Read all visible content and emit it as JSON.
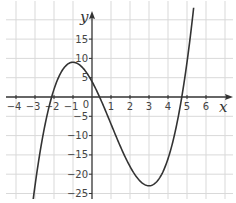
{
  "chart_data": {
    "type": "line",
    "title": "",
    "xlabel": "x",
    "ylabel": "y",
    "xlim": [
      -4.5,
      7.3
    ],
    "ylim": [
      -26.5,
      22.5
    ],
    "grid": true,
    "x_ticks": [
      -4,
      -3,
      -2,
      -1,
      0,
      1,
      2,
      3,
      4,
      5,
      6
    ],
    "x_tick_labels": [
      "-4",
      "-3",
      "-2",
      "-1",
      "0",
      "1",
      "2",
      "3",
      "4",
      "5",
      "6"
    ],
    "y_ticks": [
      -25,
      -20,
      -15,
      -10,
      -5,
      5,
      10,
      15
    ],
    "y_tick_labels": [
      "-25",
      "-20",
      "-15",
      "-10",
      "-5",
      "5",
      "10",
      "15"
    ],
    "series": [
      {
        "name": "y = x^3 - 3x^2 - 9x + 4",
        "color": "#333333",
        "x": [
          -3.1,
          -3,
          -2.5,
          -2,
          -1.5,
          -1,
          -0.5,
          0,
          0.5,
          1,
          1.5,
          2,
          2.5,
          3,
          3.5,
          4,
          4.5,
          5,
          5.35
        ],
        "values": [
          -25.6,
          -23,
          -9.1,
          2,
          7.6,
          9,
          7.4,
          4,
          -1.1,
          -7,
          -12.9,
          -18,
          -21.6,
          -23,
          -21.6,
          -16,
          -6.1,
          9,
          21.3
        ]
      }
    ],
    "key_points": {
      "local_max": [
        -1,
        9
      ],
      "local_min": [
        3,
        -23
      ],
      "y_intercept": [
        0,
        4
      ],
      "roots_approx": [
        -2.2,
        0.4,
        4.8
      ]
    }
  },
  "labels": {
    "x_axis": "x",
    "y_axis": "y",
    "origin": "0"
  },
  "colors": {
    "grid": "#d9d9d9",
    "axis": "#333333",
    "curve": "#333333"
  }
}
